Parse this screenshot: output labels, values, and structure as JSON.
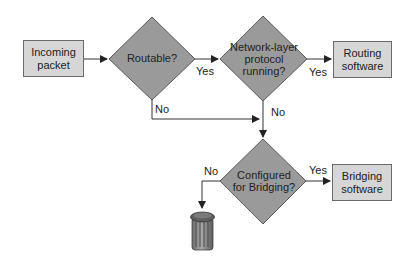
{
  "diagram": {
    "colors": {
      "box_fill": "#d6d6d6",
      "diamond_fill": "#9a9a9a",
      "stroke": "#5a5a5a",
      "line": "#333333",
      "text": "#222222"
    },
    "nodes": {
      "incoming": {
        "type": "process",
        "label_line1": "Incoming",
        "label_line2": "packet"
      },
      "routable": {
        "type": "decision",
        "label": "Routable?"
      },
      "network_layer": {
        "type": "decision",
        "label_line1": "Network-layer",
        "label_line2": "protocol",
        "label_line3": "running?"
      },
      "routing_software": {
        "type": "process",
        "label_line1": "Routing",
        "label_line2": "software"
      },
      "configured_bridging": {
        "type": "decision",
        "label_line1": "Configured",
        "label_line2": "for Bridging?"
      },
      "bridging_software": {
        "type": "process",
        "label_line1": "Bridging",
        "label_line2": "software"
      },
      "trash": {
        "type": "terminator",
        "icon": "trash-can-icon"
      }
    },
    "edges": [
      {
        "from": "incoming",
        "to": "routable",
        "label": ""
      },
      {
        "from": "routable",
        "to": "network_layer",
        "label": "Yes"
      },
      {
        "from": "routable",
        "to": "configured_bridging",
        "label": "No"
      },
      {
        "from": "network_layer",
        "to": "routing_software",
        "label": "Yes"
      },
      {
        "from": "network_layer",
        "to": "configured_bridging",
        "label": "No"
      },
      {
        "from": "configured_bridging",
        "to": "bridging_software",
        "label": "Yes"
      },
      {
        "from": "configured_bridging",
        "to": "trash",
        "label": "No"
      }
    ],
    "edge_labels": {
      "routable_yes": "Yes",
      "routable_no": "No",
      "network_yes": "Yes",
      "network_no": "No",
      "configured_yes": "Yes",
      "configured_no": "No"
    }
  }
}
